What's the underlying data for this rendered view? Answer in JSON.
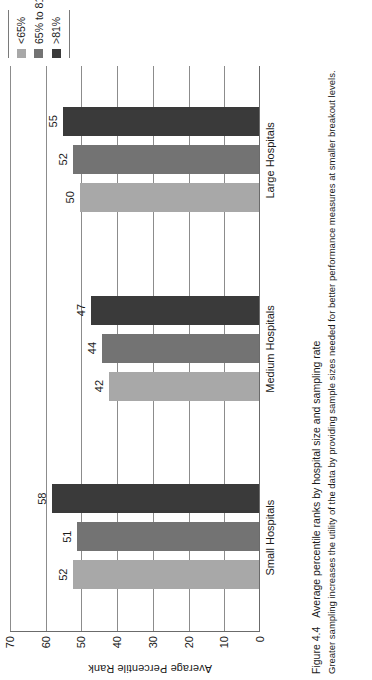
{
  "figure": {
    "caption_number": "Figure 4.4",
    "caption_title": "Average percentile ranks by hospital size and sampling rate",
    "caption_note": "Greater sampling increases the utility of the data by providing sample sizes needed for better performance measures at smaller breakout levels."
  },
  "chart_data": {
    "type": "bar",
    "title": "Average percentile ranks by hospital size and sampling rate",
    "xlabel": "",
    "ylabel": "Average Percentile Rank",
    "ylim": [
      0,
      70
    ],
    "yticks": [
      0,
      10,
      20,
      30,
      40,
      50,
      60,
      70
    ],
    "ytick_labels": [
      "0",
      "10",
      "20",
      "30",
      "40",
      "50",
      "60",
      "70"
    ],
    "grid": true,
    "legend_position": "right",
    "orientation": "vertical-bars-rotated-90ccw",
    "categories": [
      "Small Hospitals",
      "Medium Hospitals",
      "Large Hospitals"
    ],
    "series": [
      {
        "name": "<65%",
        "color": "#a8a8a8",
        "values": [
          52,
          42,
          50
        ],
        "labels": [
          "52",
          "42",
          "50"
        ]
      },
      {
        "name": "65% to 81%",
        "color": "#737373",
        "values": [
          51,
          44,
          52
        ],
        "labels": [
          "51",
          "44",
          "52"
        ]
      },
      {
        "name": ">81%",
        "color": "#3a3a3a",
        "values": [
          58,
          47,
          55
        ],
        "labels": [
          "58",
          "47",
          "55"
        ]
      }
    ]
  },
  "colors": {
    "series_light": "#a8a8a8",
    "series_medium": "#737373",
    "series_dark": "#3a3a3a",
    "axis": "#6b6b6b",
    "gridline": "#8c8c8c",
    "text": "#1a1a1a",
    "background": "#ffffff"
  }
}
